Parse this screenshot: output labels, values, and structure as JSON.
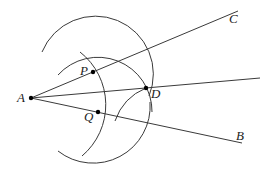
{
  "diagram": {
    "points": {
      "A": {
        "label": "A",
        "x": 31,
        "y": 98
      },
      "P": {
        "label": "P",
        "x": 93,
        "y": 72
      },
      "Q": {
        "label": "Q",
        "x": 98,
        "y": 112
      },
      "D": {
        "label": "D",
        "x": 146,
        "y": 88
      },
      "C": {
        "label": "C"
      },
      "B": {
        "label": "B"
      }
    },
    "rays": [
      "AC",
      "AD",
      "AB"
    ],
    "arcs": [
      "arc centered at A through P and Q",
      "arc centered at P through D",
      "arc centered at Q through D"
    ],
    "colors": {
      "stroke": "#3a3a3a",
      "point": "#000000",
      "label": "#222222"
    }
  }
}
